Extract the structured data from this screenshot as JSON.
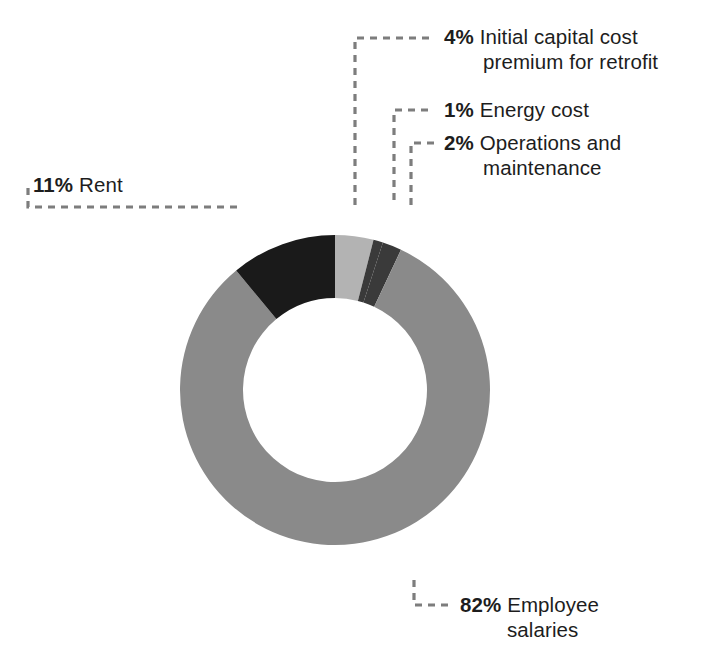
{
  "chart_data": {
    "type": "pie",
    "variant": "donut",
    "title": "",
    "subtitle": "",
    "xlabel": "",
    "ylabel": "",
    "legend_position": "callout-labels",
    "grid": false,
    "units": "percent",
    "total": 100,
    "start_angle_deg": 0,
    "direction": "clockwise",
    "center": {
      "x": 335,
      "y": 390
    },
    "outer_radius": 155,
    "inner_radius": 92,
    "categories": [
      "Initial capital cost premium for retrofit",
      "Energy cost",
      "Operations and maintenance",
      "Employee salaries",
      "Rent"
    ],
    "values": [
      4,
      1,
      2,
      82,
      11
    ],
    "colors": [
      "#b3b3b3",
      "#3a3a3a",
      "#3a3a3a",
      "#8a8a8a",
      "#1a1a1a"
    ],
    "slices": [
      {
        "key": "capital",
        "percent_label": "4%",
        "value": 4,
        "name": "Initial capital cost",
        "name_continued": "premium for retrofit",
        "color": "#b3b3b3"
      },
      {
        "key": "energy",
        "percent_label": "1%",
        "value": 1,
        "name": "Energy cost",
        "name_continued": "",
        "color": "#3a3a3a"
      },
      {
        "key": "om",
        "percent_label": "2%",
        "value": 2,
        "name": "Operations and",
        "name_continued": "maintenance",
        "color": "#3a3a3a"
      },
      {
        "key": "salaries",
        "percent_label": "82%",
        "value": 82,
        "name": "Employee",
        "name_continued": "salaries",
        "color": "#8a8a8a"
      },
      {
        "key": "rent",
        "percent_label": "11%",
        "value": 11,
        "name": "Rent",
        "name_continued": "",
        "color": "#1a1a1a"
      }
    ],
    "leader_line_color": "#7d7d7d"
  },
  "canvas": {
    "background": "#ffffff"
  },
  "footer": {
    "clipped_caption": ""
  }
}
